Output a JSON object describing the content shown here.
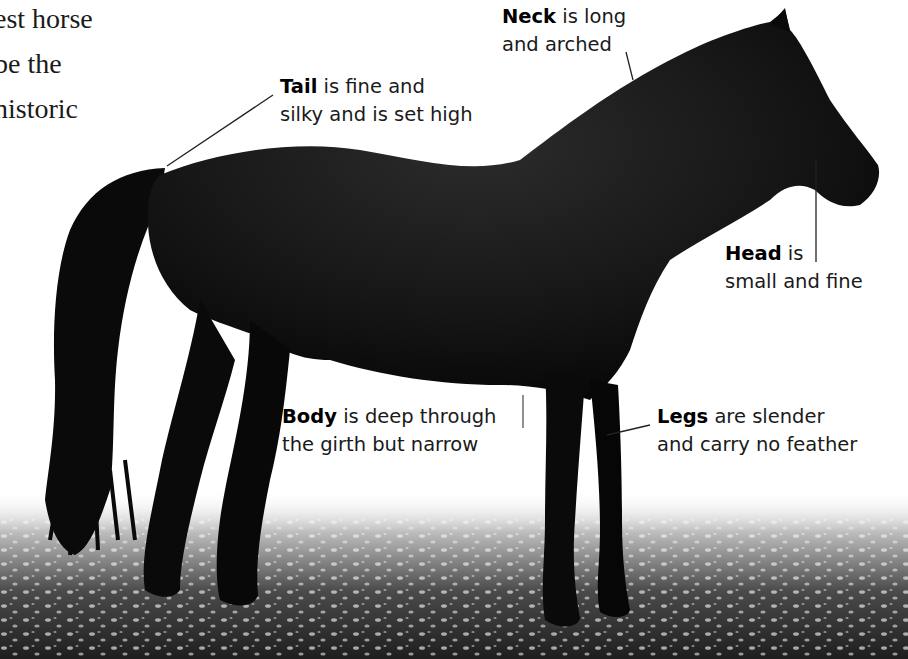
{
  "body_text": {
    "lines": [
      "est horse",
      "be the",
      "nistoric"
    ]
  },
  "callouts": {
    "neck": {
      "term": "Neck",
      "line1_rest": " is long",
      "line2": "and arched"
    },
    "tail": {
      "term": "Tail",
      "line1_rest": " is fine and",
      "line2": "silky and is set high"
    },
    "head": {
      "term": "Head",
      "line1_rest": " is",
      "line2": "small and fine"
    },
    "body": {
      "term": "Body",
      "line1_rest": " is deep through",
      "line2": "the girth but narrow"
    },
    "legs": {
      "term": "Legs",
      "line1_rest": " are slender",
      "line2": "and carry no feather"
    }
  },
  "colors": {
    "background": "#ffffff",
    "horse": "#0d0d0d",
    "text": "#1a1a1a",
    "grass": "#2a2a2a"
  }
}
